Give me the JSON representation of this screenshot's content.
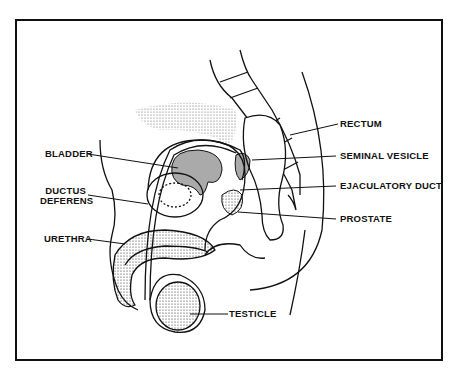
{
  "diagram": {
    "labels_left": [
      {
        "id": "bladder",
        "text": "BLADDER"
      },
      {
        "id": "ductus-deferens",
        "line1": "DUCTUS",
        "line2": "DEFERENS"
      },
      {
        "id": "urethra",
        "text": "URETHRA"
      }
    ],
    "labels_right": [
      {
        "id": "rectum",
        "text": "RECTUM"
      },
      {
        "id": "seminal-vesicle",
        "text": "SEMINAL VESICLE"
      },
      {
        "id": "ejaculatory-duct",
        "text": "EJACULATORY DUCT"
      },
      {
        "id": "prostate",
        "text": "PROSTATE"
      }
    ],
    "labels_bottom": [
      {
        "id": "testicle",
        "text": "TESTICLE"
      }
    ]
  }
}
